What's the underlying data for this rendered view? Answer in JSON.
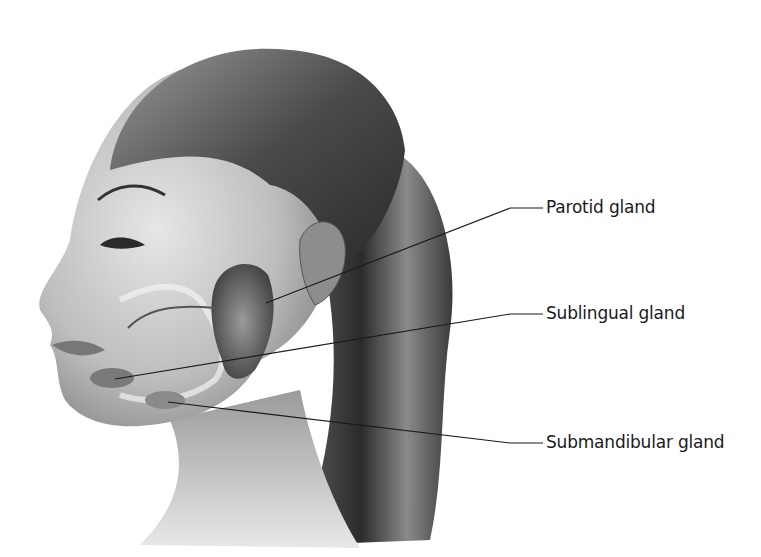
{
  "figure": {
    "background": "#ffffff",
    "ink": "#1a1a1a"
  },
  "labels": [
    {
      "text": "Parotid gland",
      "x": 546,
      "y": 199,
      "leader": [
        [
          266,
          303
        ],
        [
          510,
          208
        ],
        [
          543,
          208
        ]
      ]
    },
    {
      "text": "Sublingual gland",
      "x": 546,
      "y": 305,
      "leader": [
        [
          115,
          379
        ],
        [
          510,
          314
        ],
        [
          543,
          314
        ]
      ]
    },
    {
      "text": "Submandibular gland",
      "x": 546,
      "y": 434,
      "leader": [
        [
          168,
          402
        ],
        [
          510,
          443
        ],
        [
          543,
          443
        ]
      ]
    }
  ]
}
